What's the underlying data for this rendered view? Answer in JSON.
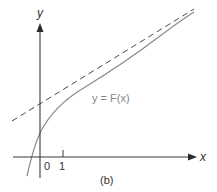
{
  "figure": {
    "caption": "(b)",
    "axes": {
      "x_label": "x",
      "y_label": "y"
    },
    "ticks": {
      "origin": "0",
      "x_one": "1"
    },
    "curve": {
      "label": "y = F(x)",
      "color": "#8a8a8a"
    },
    "asymptote": {
      "style": "dashed",
      "color": "#4a4a4a"
    }
  }
}
